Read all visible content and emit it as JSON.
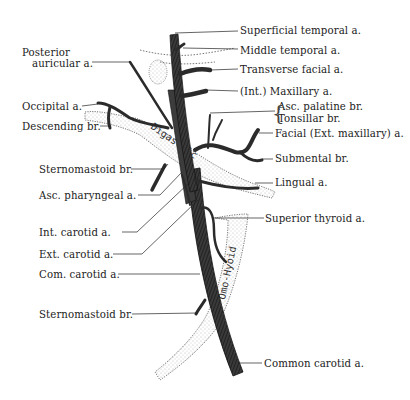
{
  "diagram": {
    "muscles": {
      "digastric": "Digastric",
      "omohyoid": "Omo-Hyoid"
    },
    "labels_left": [
      {
        "id": "posterior-auricular",
        "line1": "Posterior",
        "line2": "auricular a."
      },
      {
        "id": "occipital",
        "text": "Occipital a."
      },
      {
        "id": "descending",
        "text": "Descending br."
      },
      {
        "id": "sternomastoid-upper",
        "text": "Sternomastoid br."
      },
      {
        "id": "asc-pharyngeal",
        "text": "Asc. pharyngeal a."
      },
      {
        "id": "int-carotid",
        "text": "Int. carotid a."
      },
      {
        "id": "ext-carotid",
        "text": "Ext. carotid a."
      },
      {
        "id": "com-carotid",
        "text": "Com. carotid a."
      },
      {
        "id": "sternomastoid-lower",
        "text": "Sternomastoid br."
      }
    ],
    "labels_right": [
      {
        "id": "superficial-temporal",
        "text": "Superficial temporal a."
      },
      {
        "id": "middle-temporal",
        "text": "Middle temporal a."
      },
      {
        "id": "transverse-facial",
        "text": "Transverse facial a."
      },
      {
        "id": "int-maxillary",
        "text": "(Int.) Maxillary a."
      },
      {
        "id": "asc-palatine",
        "text": "Asc. palatine br."
      },
      {
        "id": "tonsillar",
        "text": "Tonsillar br."
      },
      {
        "id": "facial",
        "text": "Facial (Ext. maxillary) a."
      },
      {
        "id": "submental",
        "text": "Submental br."
      },
      {
        "id": "lingual",
        "text": "Lingual a."
      },
      {
        "id": "superior-thyroid",
        "text": "Superior thyroid a."
      },
      {
        "id": "common-carotid",
        "text": "Common carotid a."
      }
    ]
  }
}
